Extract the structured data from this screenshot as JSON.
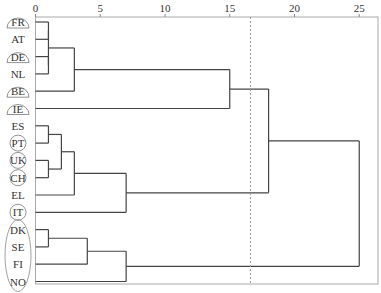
{
  "chart_data": {
    "type": "dendrogram",
    "title": "",
    "xlabel": "",
    "ylabel": "",
    "xlim": [
      0,
      26.5
    ],
    "x_ticks": [
      0,
      5,
      10,
      15,
      20,
      25
    ],
    "grid": false,
    "cut_line": {
      "value": 16.6,
      "style": "dotted"
    },
    "leaves": [
      "FR",
      "AT",
      "DE",
      "NL",
      "BE",
      "IE",
      "ES",
      "PT",
      "UK",
      "CH",
      "EL",
      "IT",
      "DK",
      "SE",
      "FI",
      "NO"
    ],
    "leaf_markers": {
      "FR": "half-ellipse",
      "DE": "half-ellipse",
      "BE": "half-ellipse",
      "IE": "half-ellipse",
      "PT": "circle",
      "UK": "circle",
      "CH": "circle",
      "IT": "circle",
      "group_ellipse": [
        "DK",
        "SE",
        "FI",
        "NO"
      ]
    },
    "merges": [
      {
        "id": "c1",
        "children": [
          "FR",
          "AT"
        ],
        "height": 1
      },
      {
        "id": "c2",
        "children": [
          "DE",
          "NL"
        ],
        "height": 1
      },
      {
        "id": "c3",
        "children": [
          "c1",
          "c2"
        ],
        "height": 1
      },
      {
        "id": "c4",
        "children": [
          "c3",
          "BE"
        ],
        "height": 3
      },
      {
        "id": "c5",
        "children": [
          "c4",
          "IE"
        ],
        "height": 15
      },
      {
        "id": "c6",
        "children": [
          "ES",
          "PT"
        ],
        "height": 1
      },
      {
        "id": "c7",
        "children": [
          "UK",
          "CH"
        ],
        "height": 1
      },
      {
        "id": "c8",
        "children": [
          "c6",
          "c7"
        ],
        "height": 2
      },
      {
        "id": "c9",
        "children": [
          "c8",
          "EL"
        ],
        "height": 3
      },
      {
        "id": "c10",
        "children": [
          "c9",
          "IT"
        ],
        "height": 7
      },
      {
        "id": "c11",
        "children": [
          "c5",
          "c10"
        ],
        "height": 18
      },
      {
        "id": "c12",
        "children": [
          "DK",
          "SE"
        ],
        "height": 1
      },
      {
        "id": "c13",
        "children": [
          "c12",
          "FI"
        ],
        "height": 4
      },
      {
        "id": "c14",
        "children": [
          "c13",
          "NO"
        ],
        "height": 7
      },
      {
        "id": "c15",
        "children": [
          "c11",
          "c14"
        ],
        "height": 25
      }
    ]
  }
}
